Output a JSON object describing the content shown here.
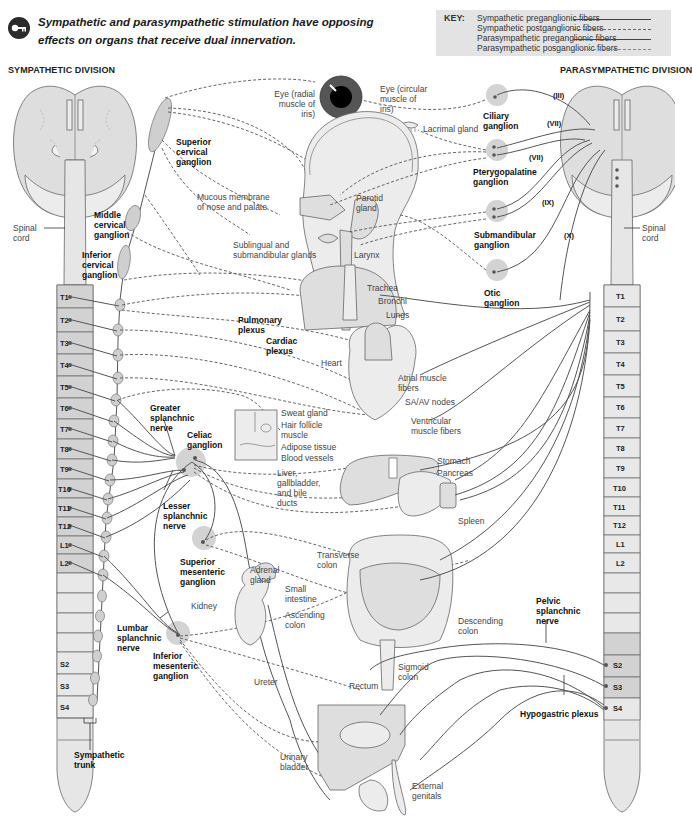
{
  "header": {
    "key_icon": "key-icon",
    "statement_line1": "Sympathetic and parasympathetic stimulation have opposing",
    "statement_line2": "effects on organs that receive dual innervation."
  },
  "legend": {
    "title": "KEY:",
    "items": [
      {
        "label": "Sympathetic preganglionic fibers",
        "style": "solid"
      },
      {
        "label": "Sympathetic postganglionic fibers",
        "style": "dashed"
      },
      {
        "label": "Parasympathetic preganglionic fibers",
        "style": "solid"
      },
      {
        "label": "Parasympathetic posganglionic fibers",
        "style": "dashed"
      }
    ],
    "background": "#e3e3e3"
  },
  "sympathetic": {
    "title": "SYMPATHETIC DIVISION",
    "spinal_cord_label": "Spinal cord",
    "segments": [
      "T1",
      "T2",
      "T3",
      "T4",
      "T5",
      "T6",
      "T7",
      "T8",
      "T9",
      "T10",
      "T11",
      "T12",
      "L1",
      "L2",
      "S2",
      "S3",
      "S4"
    ],
    "ganglia_labels": {
      "superior_cervical": "Superior cervical ganglion",
      "middle_cervical": "Middle cervical ganglion",
      "inferior_cervical": "Inferior cervical ganglion",
      "celiac": "Celiac ganglion",
      "superior_mesenteric": "Superior mesenteric ganglion",
      "inferior_mesenteric": "Inferior mesenteric ganglion"
    },
    "nerve_labels": {
      "greater_splanchnic": "Greater splanchnic nerve",
      "lesser_splanchnic": "Lesser splanchnic nerve",
      "lumbar_splanchnic": "Lumbar splanchnic nerve",
      "sympathetic_trunk": "Sympathetic trunk",
      "pulmonary_plexus": "Pulmonary plexus",
      "cardiac_plexus": "Cardiac plexus"
    }
  },
  "parasympathetic": {
    "title": "PARASYMPATHETIC DIVISION",
    "spinal_cord_label": "Spinal cord",
    "segments": [
      "T1",
      "T2",
      "T3",
      "T4",
      "T5",
      "T6",
      "T7",
      "T8",
      "T9",
      "T10",
      "T11",
      "T12",
      "L1",
      "L2",
      "S2",
      "S3",
      "S4"
    ],
    "ganglia_labels": {
      "ciliary": "Ciliary ganglion",
      "pterygopalatine": "Pterygopalatine ganglion",
      "submandibular": "Submandibular ganglion",
      "otic": "Otic ganglion"
    },
    "cranial_nerves": [
      "(III)",
      "(VII)",
      "(VII)",
      "(IX)",
      "(X)"
    ],
    "nerve_labels": {
      "pelvic_splanchnic": "Pelvic splanchnic nerve",
      "hypogastric_plexus": "Hypogastric plexus"
    }
  },
  "organs": {
    "eye_radial": "Eye (radial muscle of iris)",
    "eye_circular": "Eye (circular muscle of iris)",
    "lacrimal_gland": "Lacrimal gland",
    "mucous_membrane": "Mucous membrane of nose and palate",
    "parotid_gland": "Parotid gland",
    "sublingual": "Sublingual and submandibular glands",
    "larynx": "Larynx",
    "trachea": "Trachea",
    "bronchi": "Bronchi",
    "lungs": "Lungs",
    "heart": "Heart",
    "atrial": "Atrial muscle fibers",
    "sa_av": "SA/AV nodes",
    "ventricular": "Ventricular muscle fibers",
    "sweat_gland": "Sweat gland",
    "hair_follicle": "Hair follicle muscle",
    "adipose": "Adipose tissue",
    "blood_vessels": "Blood vessels",
    "liver": "Liver, gallbladder, and bile ducts",
    "stomach": "Stomach",
    "pancreas": "Pancreas",
    "spleen": "Spleen",
    "transverse_colon": "Transverse colon",
    "small_intestine": "Small intestine",
    "ascending_colon": "Ascending colon",
    "descending_colon": "Descending colon",
    "sigmoid_colon": "Sigmoid colon",
    "rectum": "Rectum",
    "adrenal_gland": "Adrenal gland",
    "kidney": "Kidney",
    "ureter": "Ureter",
    "urinary_bladder": "Urinary bladder",
    "external_genitals": "External genitals"
  },
  "colors": {
    "brain_fill": "#d8d8d8",
    "cord_fill": "#e6e6e6",
    "segment_fill": "#d2d2d2",
    "ganglion_fill": "#c8c8c8",
    "ganglion_halo": "#cfcfcf",
    "line": "#555555",
    "organ_fill": "#dedede"
  }
}
